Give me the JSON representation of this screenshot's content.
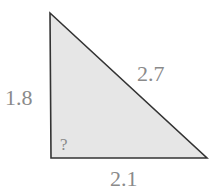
{
  "diagram": {
    "type": "right-triangle",
    "fill_color": "#e6e6e6",
    "stroke_color": "#333333",
    "label_color": "#8a8a8a",
    "vertices": {
      "top": [
        50,
        13
      ],
      "bottom_left": [
        51,
        158
      ],
      "bottom_right": [
        207,
        158
      ]
    },
    "sides": {
      "vertical": "1.8",
      "hypotenuse": "2.7",
      "base": "2.1"
    },
    "angle_label": "?"
  }
}
